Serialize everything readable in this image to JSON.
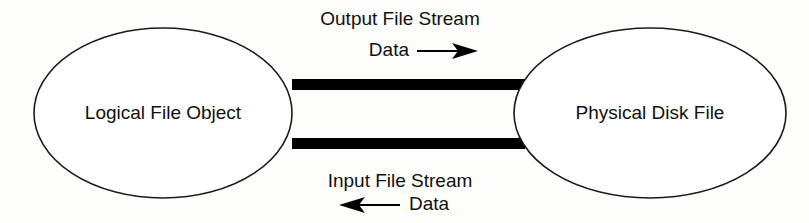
{
  "diagram": {
    "type": "block-flow-diagram",
    "background_color": "#fdfdfc",
    "stroke_color": "#1a1a1a",
    "fill_color": "#ffffff",
    "bar_color": "#000000",
    "text_color": "#111111",
    "nodes": [
      {
        "id": "logical-file-object",
        "label": "Logical File Object",
        "shape": "ellipse",
        "cx": 163,
        "cy": 113,
        "rx": 129,
        "ry": 85
      },
      {
        "id": "physical-disk-file",
        "label": "Physical Disk File",
        "shape": "ellipse",
        "cx": 650,
        "cy": 113,
        "rx": 136,
        "ry": 85
      }
    ],
    "connectors": [
      {
        "id": "output-stream-bar",
        "label": "Output File Stream",
        "flow_label": "Data",
        "direction": "right",
        "x": 292,
        "y": 79,
        "width": 233,
        "height": 11
      },
      {
        "id": "input-stream-bar",
        "label": "Input File Stream",
        "flow_label": "Data",
        "direction": "left",
        "x": 292,
        "y": 138,
        "width": 233,
        "height": 11
      }
    ],
    "labels": {
      "output_stream": "Output File Stream",
      "output_flow": "Data",
      "input_stream": "Input File Stream",
      "input_flow": "Data"
    }
  }
}
